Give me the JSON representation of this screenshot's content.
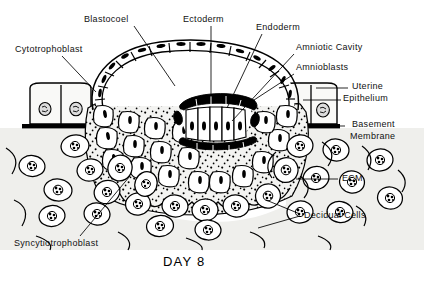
{
  "figure": {
    "title_caption": "DAY 8",
    "stage_day": 8,
    "colors": {
      "ink": "#000000",
      "background": "#ffffff",
      "syncytiotrophoblast_fill": "#f2f2f0",
      "decidua_fill": "#efefec",
      "epithelium_fill": "#f7f7f5",
      "nucleus_fill": "#dcdcdc"
    },
    "labels": [
      {
        "id": "blastocoel",
        "text": "Blastocoel",
        "x": 84,
        "y": 14,
        "anchor": "start",
        "leader": [
          [
            134,
            26
          ],
          [
            175,
            86
          ]
        ]
      },
      {
        "id": "cytotrophoblast",
        "text": "Cytotrophoblast",
        "x": 15,
        "y": 44,
        "anchor": "start",
        "leader": [
          [
            62,
            56
          ],
          [
            96,
            92
          ]
        ]
      },
      {
        "id": "ectoderm",
        "text": "Ectoderm",
        "x": 183,
        "y": 14,
        "anchor": "start",
        "leader": [
          [
            211,
            26
          ],
          [
            211,
            97
          ]
        ]
      },
      {
        "id": "endoderm",
        "text": "Endoderm",
        "x": 256,
        "y": 22,
        "anchor": "start",
        "leader": [
          [
            262,
            34
          ],
          [
            227,
            108
          ]
        ]
      },
      {
        "id": "amniotic-cavity",
        "text": "Amniotic Cavity",
        "x": 296,
        "y": 42,
        "anchor": "start",
        "leader": [
          [
            294,
            54
          ],
          [
            232,
            121
          ]
        ]
      },
      {
        "id": "amnioblasts",
        "text": "Amnioblasts",
        "x": 296,
        "y": 62,
        "anchor": "start",
        "leader": [
          [
            294,
            74
          ],
          [
            254,
            100
          ]
        ]
      },
      {
        "id": "uterine-epithelium",
        "text": "Uterine",
        "x": 352,
        "y": 81,
        "anchor": "start",
        "leader": [
          [
            346,
            88
          ],
          [
            316,
            88
          ]
        ]
      },
      {
        "id": "uterine-epithelium-2",
        "text": "Epithelium",
        "x": 343,
        "y": 93,
        "anchor": "start",
        "leader": [
          [
            340,
            100
          ],
          [
            304,
            100
          ]
        ]
      },
      {
        "id": "basement-membrane",
        "text": "Basement",
        "x": 352,
        "y": 119,
        "anchor": "start",
        "leader": [
          [
            344,
            125
          ],
          [
            336,
            125
          ]
        ]
      },
      {
        "id": "basement-membrane-2",
        "text": "Membrane",
        "x": 350,
        "y": 131,
        "anchor": "start",
        "leader": null
      },
      {
        "id": "ecm",
        "text": "ECM",
        "x": 342,
        "y": 173,
        "anchor": "start",
        "leader": [
          [
            338,
            179
          ],
          [
            296,
            179
          ]
        ]
      },
      {
        "id": "decidual-cells",
        "text": "Decidual Cells",
        "x": 304,
        "y": 210,
        "anchor": "start",
        "leader": [
          [
            300,
            216
          ],
          [
            266,
            200
          ]
        ]
      },
      {
        "id": "syncytiotrophoblast",
        "text": "Syncytiotrophoblast",
        "x": 14,
        "y": 238,
        "anchor": "start",
        "leader": [
          [
            80,
            236
          ],
          [
            130,
            176
          ]
        ]
      }
    ],
    "structures": [
      {
        "name": "blastocoel",
        "description": "large empty cavity of the blastocyst"
      },
      {
        "name": "cytotrophoblast",
        "description": "inner cellular trophoblast layer of cuboidal cells"
      },
      {
        "name": "syncytiotrophoblast",
        "description": "outer stippled multinucleate invasive layer"
      },
      {
        "name": "ectoderm",
        "description": "columnar epiblast layer of the bilaminar disc"
      },
      {
        "name": "endoderm",
        "description": "hypoblast layer lining the blastocoel"
      },
      {
        "name": "amniotic-cavity",
        "description": "small cavity above the epiblast"
      },
      {
        "name": "amnioblasts",
        "description": "flattened cells roofing the amniotic cavity"
      },
      {
        "name": "uterine-epithelium",
        "description": "columnar surface epithelium of the endometrium"
      },
      {
        "name": "basement-membrane",
        "description": "thick black line under the uterine epithelium"
      },
      {
        "name": "ecm",
        "description": "extracellular matrix between decidual cells"
      },
      {
        "name": "decidual-cells",
        "description": "rounded stromal cells with granular nuclei"
      }
    ]
  }
}
